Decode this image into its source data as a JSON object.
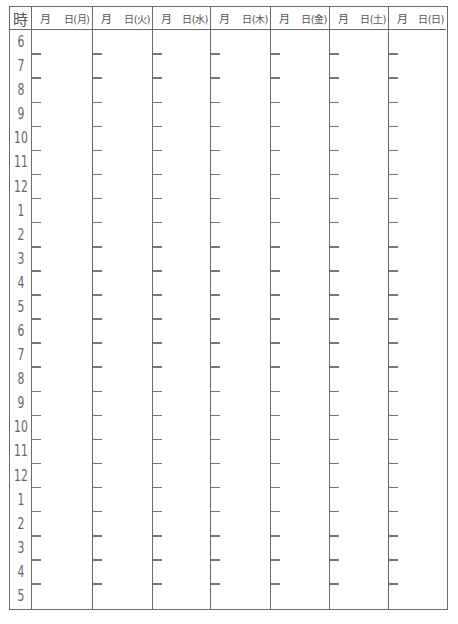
{
  "header": {
    "hour_label": "時",
    "days": [
      {
        "month_label": "月",
        "day_label": "日(月)"
      },
      {
        "month_label": "月",
        "day_label": "日(火)"
      },
      {
        "month_label": "月",
        "day_label": "日(水)"
      },
      {
        "month_label": "月",
        "day_label": "日(木)"
      },
      {
        "month_label": "月",
        "day_label": "日(金)"
      },
      {
        "month_label": "月",
        "day_label": "日(土)"
      },
      {
        "month_label": "月",
        "day_label": "日(日)"
      }
    ]
  },
  "hours": [
    "6",
    "7",
    "8",
    "9",
    "10",
    "11",
    "12",
    "1",
    "2",
    "3",
    "4",
    "5",
    "6",
    "7",
    "8",
    "9",
    "10",
    "11",
    "12",
    "1",
    "2",
    "3",
    "4",
    "5"
  ],
  "colors": {
    "line": "#6a6a6a",
    "text": "#555555"
  }
}
